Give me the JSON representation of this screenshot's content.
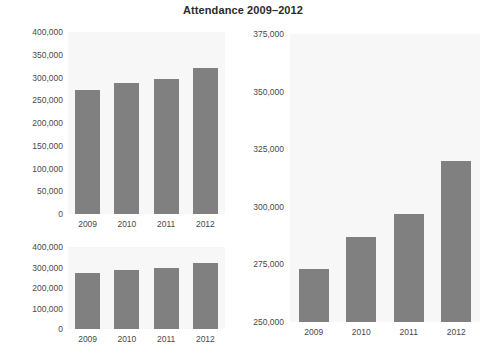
{
  "chart_data": [
    {
      "id": "panel-a",
      "type": "bar",
      "title": "Attendance 2009–2012",
      "position": "top-left",
      "categories": [
        "2009",
        "2010",
        "2011",
        "2012"
      ],
      "values": [
        273000,
        287000,
        297000,
        320000
      ],
      "xlabel": "",
      "ylabel": "",
      "ylim": [
        0,
        400000
      ],
      "yticks": [
        0,
        50000,
        100000,
        150000,
        200000,
        250000,
        300000,
        350000,
        400000
      ],
      "ytick_labels": [
        "0",
        "50,000",
        "100,000",
        "150,000",
        "200,000",
        "250,000",
        "300,000",
        "350,000",
        "400,000"
      ],
      "grid": false,
      "legend": "none",
      "bar_color": "#808080",
      "plot_bg": "#f7f7f7"
    },
    {
      "id": "panel-b",
      "type": "bar",
      "title": "",
      "position": "bottom-left",
      "categories": [
        "2009",
        "2010",
        "2011",
        "2012"
      ],
      "values": [
        273000,
        287000,
        297000,
        320000
      ],
      "xlabel": "",
      "ylabel": "",
      "ylim": [
        0,
        400000
      ],
      "yticks": [
        0,
        100000,
        200000,
        300000,
        400000
      ],
      "ytick_labels": [
        "0",
        "100,000",
        "200,000",
        "300,000",
        "400,000"
      ],
      "grid": false,
      "legend": "none",
      "bar_color": "#808080",
      "plot_bg": "#f7f7f7"
    },
    {
      "id": "panel-c",
      "type": "bar",
      "title": "",
      "position": "right",
      "categories": [
        "2009",
        "2010",
        "2011",
        "2012"
      ],
      "values": [
        273000,
        287000,
        297000,
        320000
      ],
      "xlabel": "",
      "ylabel": "",
      "ylim": [
        250000,
        375000
      ],
      "yticks": [
        250000,
        275000,
        300000,
        325000,
        350000,
        375000
      ],
      "ytick_labels": [
        "250,000",
        "275,000",
        "300,000",
        "325,000",
        "350,000",
        "375,000"
      ],
      "grid": false,
      "legend": "none",
      "bar_color": "#808080",
      "plot_bg": "#f7f7f7"
    }
  ],
  "figure": {
    "title": "Attendance 2009–2012"
  }
}
